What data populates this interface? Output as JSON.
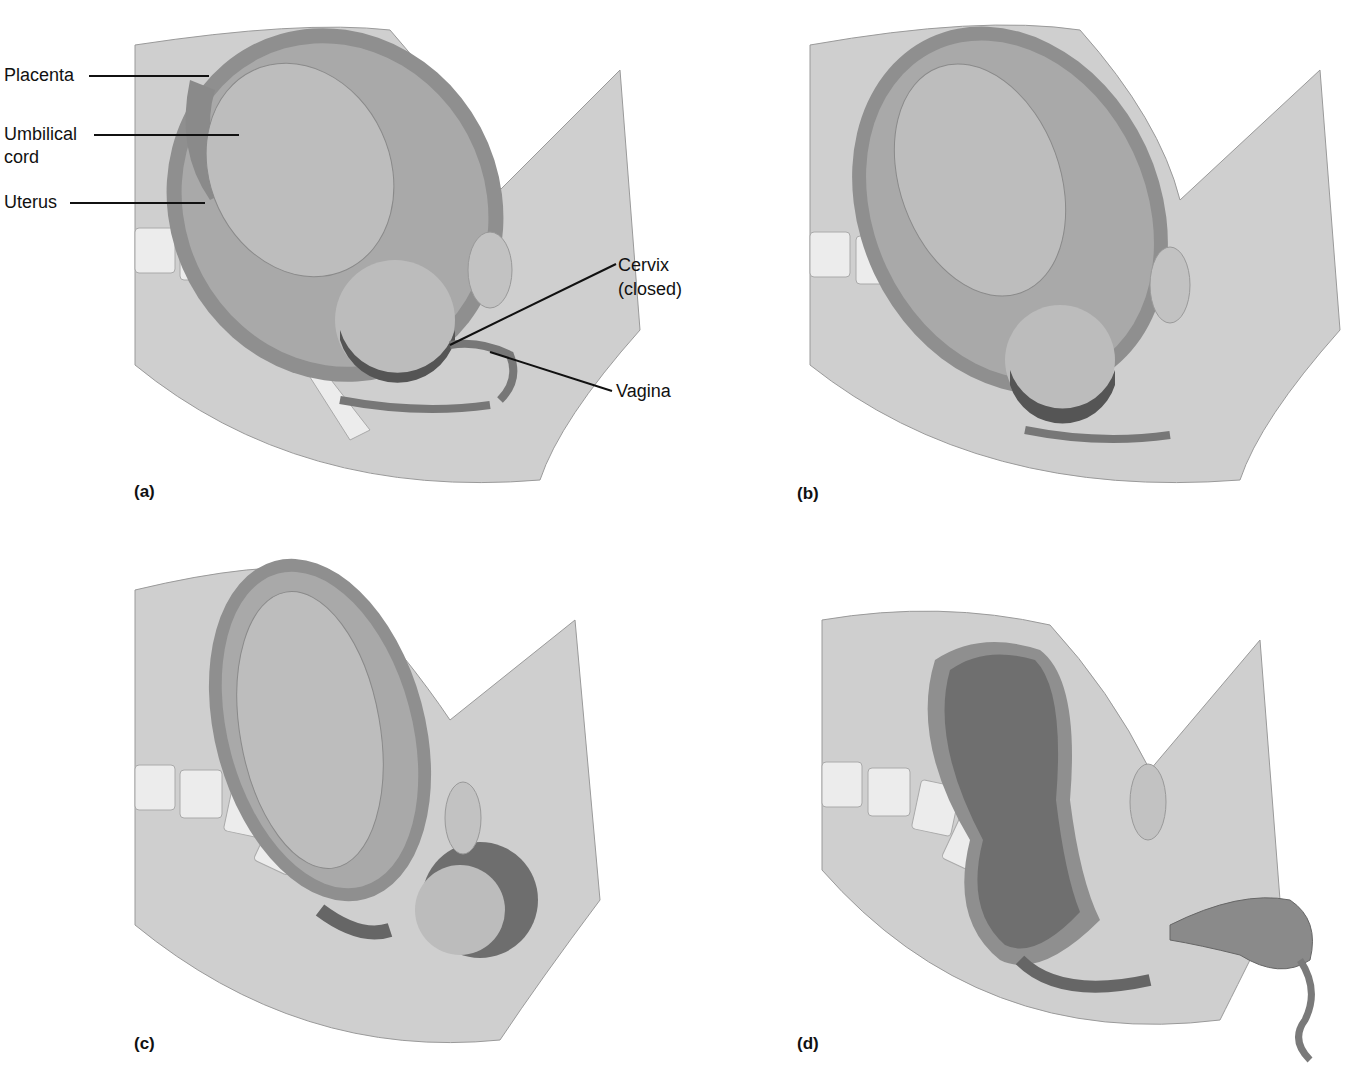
{
  "figure": {
    "panels": [
      {
        "id": "a",
        "label": "(a)",
        "stage": "fetus head-down, cervix closed"
      },
      {
        "id": "b",
        "label": "(b)",
        "stage": "fetus descending"
      },
      {
        "id": "c",
        "label": "(c)",
        "stage": "head emerging"
      },
      {
        "id": "d",
        "label": "(d)",
        "stage": "placenta delivered"
      }
    ],
    "callouts": {
      "placenta": "Placenta",
      "umbilical_cord_line1": "Umbilical",
      "umbilical_cord_line2": "cord",
      "uterus": "Uterus",
      "cervix_line1": "Cervix",
      "cervix_line2": "(closed)",
      "vagina": "Vagina"
    },
    "colors": {
      "skin": "#c9c9c9",
      "skin_dark": "#9a9a9a",
      "uterus_wall": "#8c8c8c",
      "cavity": "#6e6e6e",
      "bone": "#e6e6e6",
      "line": "#111111"
    }
  }
}
